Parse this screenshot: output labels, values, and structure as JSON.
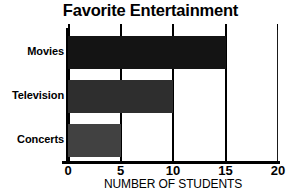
{
  "chart_data": {
    "type": "bar",
    "orientation": "horizontal",
    "title": "Favorite Entertainment",
    "xlabel": "NUMBER OF STUDENTS",
    "ylabel": "",
    "categories": [
      "Movies",
      "Television",
      "Concerts"
    ],
    "values": [
      15,
      10,
      5
    ],
    "xlim": [
      0,
      20
    ],
    "xticks": [
      0,
      5,
      10,
      15,
      20
    ],
    "xtick_labels": [
      "0",
      "5",
      "10",
      "15",
      "20"
    ],
    "grid": true,
    "legend": false,
    "bar_colors": [
      "#141414",
      "#2e2e2e",
      "#414141"
    ],
    "axis_color": "#000000",
    "background": "#ffffff"
  }
}
